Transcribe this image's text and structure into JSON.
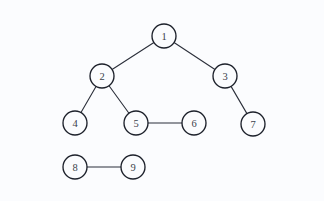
{
  "diagram": {
    "background_color": "#fbfcfe",
    "node_fill": "#fbfcfe",
    "node_stroke": "#1d212b",
    "edge_color": "#2b2f3a",
    "label_color": "#3a3f4a",
    "node_radius": 12,
    "width": 324,
    "height": 201
  },
  "chart_data": {
    "type": "diagram",
    "nodes": [
      {
        "id": "1",
        "label": "1",
        "x": 164,
        "y": 36
      },
      {
        "id": "2",
        "label": "2",
        "x": 102,
        "y": 76
      },
      {
        "id": "3",
        "label": "3",
        "x": 225,
        "y": 76
      },
      {
        "id": "4",
        "label": "4",
        "x": 75,
        "y": 123
      },
      {
        "id": "5",
        "label": "5",
        "x": 136,
        "y": 123
      },
      {
        "id": "6",
        "label": "6",
        "x": 194,
        "y": 123
      },
      {
        "id": "7",
        "label": "7",
        "x": 253,
        "y": 124
      },
      {
        "id": "8",
        "label": "8",
        "x": 75,
        "y": 167
      },
      {
        "id": "9",
        "label": "9",
        "x": 133,
        "y": 167
      }
    ],
    "edges": [
      {
        "source": "1",
        "target": "2"
      },
      {
        "source": "1",
        "target": "3"
      },
      {
        "source": "2",
        "target": "4"
      },
      {
        "source": "2",
        "target": "5"
      },
      {
        "source": "3",
        "target": "7"
      },
      {
        "source": "5",
        "target": "6"
      },
      {
        "source": "8",
        "target": "9"
      }
    ],
    "components": [
      [
        "1",
        "2",
        "3",
        "4",
        "5",
        "6",
        "7"
      ],
      [
        "8",
        "9"
      ]
    ]
  }
}
